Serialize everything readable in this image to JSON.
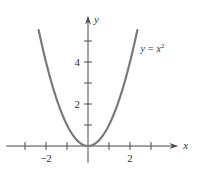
{
  "chart_data": {
    "type": "line",
    "title": "",
    "xlabel": "x",
    "ylabel": "y",
    "xlim": [
      -3.9,
      4.3
    ],
    "ylim": [
      -0.8,
      6.2
    ],
    "x_ticks": [
      -3,
      -2,
      -1,
      1,
      2,
      3
    ],
    "y_ticks": [
      1,
      2,
      3,
      4,
      5
    ],
    "x_tick_labels": [
      {
        "value": -2,
        "label": "−2"
      },
      {
        "value": 2,
        "label": "2"
      }
    ],
    "y_tick_labels": [
      {
        "value": 2,
        "label": "2"
      },
      {
        "value": 4,
        "label": "4"
      }
    ],
    "grid": false,
    "series": [
      {
        "name": "y = x^2",
        "function": "x^2",
        "domain": [
          -2.35,
          2.35
        ],
        "color": "#7a7a7a"
      }
    ],
    "annotations": [
      {
        "text_main": "y = x",
        "text_sup": "2",
        "x": 2.4,
        "y": 4.6
      }
    ],
    "axis_color": "#4a4a4a"
  }
}
